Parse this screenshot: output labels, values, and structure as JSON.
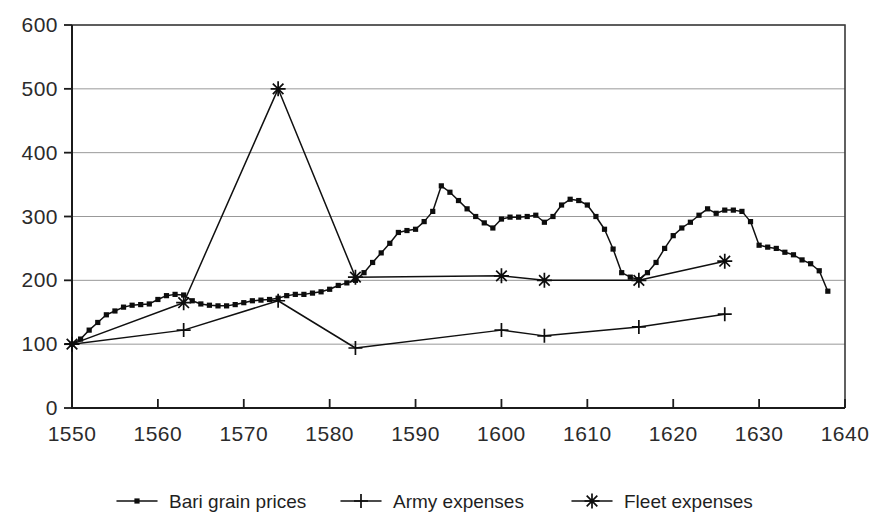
{
  "chart_data": {
    "type": "line",
    "title": "",
    "subtitle": "",
    "xlabel": "",
    "ylabel": "",
    "xlim": [
      1550,
      1640
    ],
    "ylim": [
      0,
      600
    ],
    "grid": true,
    "legend_position": "bottom",
    "x_ticks": [
      "1550",
      "1560",
      "1570",
      "1580",
      "1590",
      "1600",
      "1610",
      "1620",
      "1630",
      "1640"
    ],
    "y_ticks": [
      "0",
      "100",
      "200",
      "300",
      "400",
      "500",
      "600"
    ],
    "series": [
      {
        "name": "Bari grain prices",
        "marker": "square",
        "x": [
          1550,
          1551,
          1552,
          1553,
          1554,
          1555,
          1556,
          1557,
          1558,
          1559,
          1560,
          1561,
          1562,
          1563,
          1564,
          1565,
          1566,
          1567,
          1568,
          1569,
          1570,
          1571,
          1572,
          1573,
          1574,
          1575,
          1576,
          1577,
          1578,
          1579,
          1580,
          1581,
          1582,
          1583,
          1584,
          1585,
          1586,
          1587,
          1588,
          1589,
          1590,
          1591,
          1592,
          1593,
          1594,
          1595,
          1596,
          1597,
          1598,
          1599,
          1600,
          1601,
          1602,
          1603,
          1604,
          1605,
          1606,
          1607,
          1608,
          1609,
          1610,
          1611,
          1612,
          1613,
          1614,
          1615,
          1616,
          1617,
          1618,
          1619,
          1620,
          1621,
          1622,
          1623,
          1624,
          1625,
          1626,
          1627,
          1628,
          1629,
          1630,
          1631,
          1632,
          1633,
          1634,
          1635,
          1636,
          1637,
          1638
        ],
        "values": [
          100,
          108,
          122,
          134,
          146,
          152,
          158,
          161,
          162,
          163,
          170,
          176,
          178,
          177,
          168,
          163,
          161,
          160,
          160,
          162,
          165,
          168,
          169,
          170,
          172,
          176,
          178,
          178,
          180,
          182,
          186,
          192,
          196,
          200,
          212,
          228,
          243,
          258,
          275,
          278,
          280,
          292,
          308,
          348,
          338,
          325,
          312,
          300,
          290,
          282,
          296,
          299,
          299,
          300,
          302,
          291,
          300,
          318,
          327,
          325,
          318,
          300,
          280,
          249,
          212,
          205,
          201,
          212,
          228,
          250,
          270,
          282,
          291,
          302,
          312,
          305,
          310,
          310,
          308,
          292,
          255,
          252,
          250,
          244,
          240,
          232,
          226,
          215,
          183
        ]
      },
      {
        "name": "Army expenses",
        "marker": "plus",
        "x": [
          1550,
          1563,
          1574,
          1583,
          1600,
          1605,
          1616,
          1626
        ],
        "values": [
          100,
          122,
          168,
          94,
          122,
          113,
          127,
          147
        ]
      },
      {
        "name": "Fleet expenses",
        "marker": "asterisk",
        "x": [
          1550,
          1563,
          1574,
          1583,
          1600,
          1605,
          1616,
          1626
        ],
        "values": [
          100,
          165,
          500,
          205,
          207,
          200,
          200,
          230
        ]
      }
    ]
  },
  "legend": {
    "items": [
      {
        "label": "Bari grain prices",
        "marker": "square"
      },
      {
        "label": "Army expenses",
        "marker": "plus"
      },
      {
        "label": "Fleet expenses",
        "marker": "asterisk"
      }
    ]
  },
  "colors": {
    "ink": "#101010",
    "grid": "#8d8d8d",
    "background": "#ffffff"
  }
}
